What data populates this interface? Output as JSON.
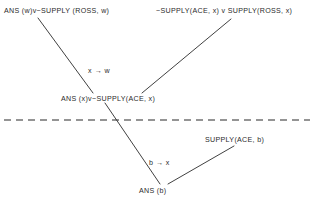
{
  "diagram": {
    "type": "resolution-proof-tree",
    "title": "",
    "background_color": "#ffffff",
    "ink_color": "#2b2b2b",
    "nodes": [
      {
        "id": "clause-top-left",
        "text": "ANS (w)v~SUPPLY (ROSS, w)",
        "role": "top-clause",
        "x": 4,
        "y": 7
      },
      {
        "id": "clause-top-right",
        "text": "~SUPPLY(ACE, x) v SUPPLY(ROSS, x)",
        "role": "top-clause",
        "x": 156,
        "y": 7
      },
      {
        "id": "clause-middle",
        "text": "ANS (x)v~SUPPLY(ACE, x)",
        "role": "resolvent",
        "x": 61,
        "y": 95
      },
      {
        "id": "clause-supply-ace",
        "text": "SUPPLY(ACE, b)",
        "role": "input-clause",
        "x": 205,
        "y": 136
      },
      {
        "id": "clause-ans-b",
        "text": "ANS (b)",
        "role": "resolvent",
        "x": 139,
        "y": 187
      }
    ],
    "edge_labels": [
      {
        "id": "label-x-w",
        "text": "x → w",
        "meaning": "unifier-substitution",
        "x": 88,
        "y": 67
      },
      {
        "id": "label-b-x",
        "text": "b → x",
        "meaning": "unifier-substitution",
        "x": 149,
        "y": 159
      }
    ],
    "edges": [
      {
        "id": "edge-topleft-to-middle",
        "from": "clause-top-left",
        "to": "clause-middle",
        "x1": 38,
        "y1": 18,
        "x2": 93,
        "y2": 93
      },
      {
        "id": "edge-topright-to-middle",
        "from": "clause-top-right",
        "to": "clause-middle",
        "x1": 231,
        "y1": 19,
        "x2": 142,
        "y2": 93
      },
      {
        "id": "edge-middle-to-ansb",
        "from": "clause-middle",
        "to": "clause-ans-b",
        "x1": 105,
        "y1": 103,
        "x2": 160,
        "y2": 184
      },
      {
        "id": "edge-supply-to-ansb",
        "from": "clause-supply-ace",
        "to": "clause-ans-b",
        "x1": 234,
        "y1": 146,
        "x2": 168,
        "y2": 184
      }
    ],
    "separator": {
      "id": "dashed-separator",
      "style": "dashed",
      "x1": 4,
      "x2": 310,
      "y": 120,
      "dash": "7 5"
    }
  }
}
